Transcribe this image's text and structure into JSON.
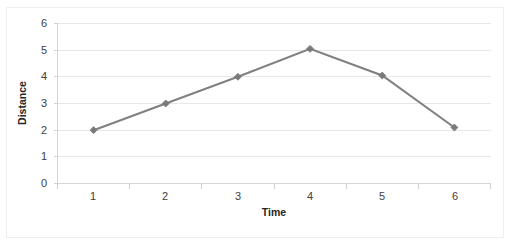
{
  "chart_data": {
    "type": "line",
    "title": "",
    "xlabel": "Time",
    "ylabel": "Distance",
    "categories": [
      "1",
      "2",
      "3",
      "4",
      "5",
      "6"
    ],
    "x": [
      1,
      2,
      3,
      4,
      5,
      6
    ],
    "series": [
      {
        "name": "Distance",
        "values": [
          2.0,
          3.0,
          4.0,
          5.05,
          4.05,
          2.1
        ]
      }
    ],
    "ylim": [
      0,
      6
    ],
    "ytick_labels": [
      "0",
      "1",
      "2",
      "3",
      "4",
      "5",
      "6"
    ],
    "ytick_values": [
      0,
      1,
      2,
      3,
      4,
      5,
      6
    ],
    "xtick_labels": [
      "1",
      "2",
      "3",
      "4",
      "5",
      "6"
    ],
    "grid": "horizontal",
    "legend": "none",
    "marker": "diamond",
    "colors": {
      "series": "#808080",
      "marker": "#7a7a7a",
      "gridline": "#e8e8e8",
      "axis": "#d6d6d6",
      "tick_label": "#404040",
      "axis_title": "#262626",
      "plot_background": "#ffffff",
      "frame_border": "#efefef"
    }
  },
  "axes": {
    "y_title": "Distance",
    "x_title": "Time",
    "y_ticks": [
      {
        "label": "6",
        "value": 6
      },
      {
        "label": "5",
        "value": 5
      },
      {
        "label": "4",
        "value": 4
      },
      {
        "label": "3",
        "value": 3
      },
      {
        "label": "2",
        "value": 2
      },
      {
        "label": "1",
        "value": 1
      },
      {
        "label": "0",
        "value": 0
      }
    ],
    "x_ticks": [
      {
        "label": "1"
      },
      {
        "label": "2"
      },
      {
        "label": "3"
      },
      {
        "label": "4"
      },
      {
        "label": "5"
      },
      {
        "label": "6"
      }
    ]
  }
}
